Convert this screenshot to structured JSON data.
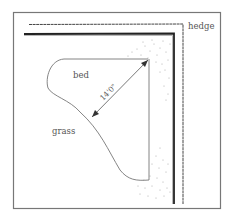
{
  "diagram": {
    "labels": {
      "hedge": "hedge",
      "bed": "bed",
      "grass": "grass",
      "dimension": "14'0\""
    },
    "colors": {
      "frame": "#666666",
      "hedge": "#333333",
      "line": "#777777",
      "stipple": "#999999",
      "text": "#555555"
    }
  }
}
